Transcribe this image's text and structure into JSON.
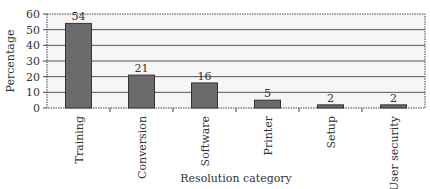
{
  "chart_data": {
    "type": "bar",
    "title": "",
    "xlabel": "Resolution category",
    "ylabel": "Percentage",
    "categories": [
      "Training",
      "Conversion",
      "Software",
      "Printer",
      "Setup",
      "User security"
    ],
    "values": [
      54,
      21,
      16,
      5,
      2,
      2
    ],
    "data_labels": [
      "54",
      "21",
      "16",
      "5",
      "2",
      "2"
    ],
    "yticks": [
      0,
      10,
      20,
      30,
      40,
      50,
      60
    ],
    "ylim": [
      0,
      60
    ],
    "grid": true,
    "legend": null,
    "colors": {
      "bar": "#6b6b6b",
      "bar_border": "#333333",
      "grid": "#555555",
      "plot_bg": "#f4f4f4"
    }
  }
}
